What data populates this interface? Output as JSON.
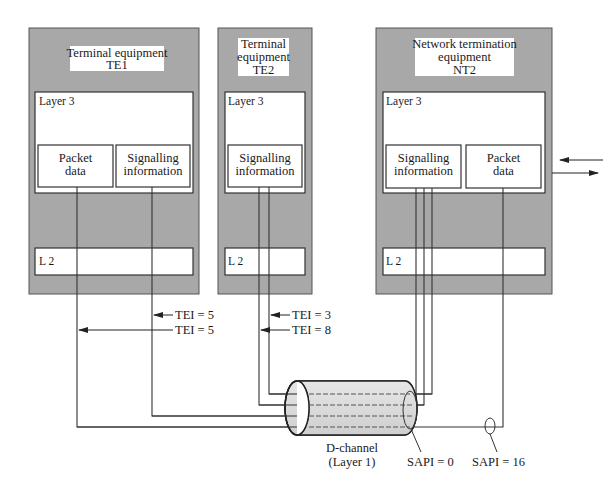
{
  "colors": {
    "device_fill": "#a8a8a8",
    "layer_fill": "#ffffff",
    "line": "#333333",
    "cable_fill": "#d8d8d8"
  },
  "devices": [
    {
      "id": "TE1",
      "title_line1": "Terminal equipment",
      "title_line2": "TE1",
      "layer3_label": "Layer 3",
      "l2_label": "L 2",
      "boxes": [
        {
          "line1": "Packet",
          "line2": "data"
        },
        {
          "line1": "Signalling",
          "line2": "information"
        }
      ]
    },
    {
      "id": "TE2",
      "title_line1": "Terminal",
      "title_line2": "equipment",
      "title_line3": "TE2",
      "layer3_label": "Layer 3",
      "l2_label": "L 2",
      "boxes": [
        {
          "line1": "Signalling",
          "line2": "information"
        }
      ]
    },
    {
      "id": "NT2",
      "title_line1": "Network termination",
      "title_line2": "equipment",
      "title_line3": "NT2",
      "layer3_label": "Layer 3",
      "l2_label": "L 2",
      "boxes": [
        {
          "line1": "Signalling",
          "line2": "information"
        },
        {
          "line1": "Packet",
          "line2": "data"
        }
      ]
    }
  ],
  "tei_labels": [
    {
      "device": "TE1",
      "text": "TEI = 5"
    },
    {
      "device": "TE1",
      "text": "TEI = 5"
    },
    {
      "device": "TE2",
      "text": "TEI = 3"
    },
    {
      "device": "TE2",
      "text": "TEI = 8"
    }
  ],
  "cable": {
    "line1": "D-channel",
    "line2": "(Layer 1)"
  },
  "sapi_labels": [
    {
      "text": "SAPI = 0"
    },
    {
      "text": "SAPI = 16"
    }
  ]
}
